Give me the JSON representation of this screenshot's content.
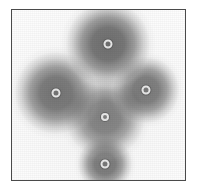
{
  "image": {
    "kind": "scanning-probe-micrograph",
    "width": 203,
    "height": 196,
    "background_color": "#ffffff",
    "frame": {
      "x": 11,
      "y": 9,
      "width": 175,
      "height": 172,
      "border_color": "#4a4a4a",
      "border_width": 1,
      "fill_color": "#ffffff"
    },
    "colormap": "grayscale",
    "lobe_dark_color": "#5a5a5a",
    "lobe_core_color": "#4e4e4e",
    "marker_ring_color": "#e8e8e8",
    "caption": ""
  },
  "chart_data": {
    "type": "heatmap",
    "title": "",
    "xlabel": "",
    "ylabel": "",
    "grid": false,
    "legend": "none",
    "xlim": [
      0,
      175
    ],
    "ylim": [
      0,
      172
    ],
    "features": [
      {
        "name": "top-lobe",
        "cx": 96,
        "cy": 34,
        "radius": 48,
        "intensity": 0.92,
        "marker": {
          "cx": 96,
          "cy": 34,
          "outer_d": 9,
          "inner_d": 5
        }
      },
      {
        "name": "left-lobe",
        "cx": 44,
        "cy": 83,
        "radius": 47,
        "intensity": 0.88,
        "marker": {
          "cx": 44,
          "cy": 83,
          "outer_d": 9,
          "inner_d": 5
        }
      },
      {
        "name": "right-lobe",
        "cx": 134,
        "cy": 80,
        "radius": 38,
        "intensity": 0.85,
        "marker": {
          "cx": 134,
          "cy": 80,
          "outer_d": 9,
          "inner_d": 5
        }
      },
      {
        "name": "center-lobe",
        "cx": 93,
        "cy": 107,
        "radius": 46,
        "intensity": 0.8,
        "marker": {
          "cx": 93,
          "cy": 107,
          "outer_d": 8,
          "inner_d": 4
        }
      },
      {
        "name": "bottom-lobe",
        "cx": 93,
        "cy": 154,
        "radius": 31,
        "intensity": 0.86,
        "marker": {
          "cx": 93,
          "cy": 154,
          "outer_d": 9,
          "inner_d": 5
        }
      }
    ],
    "markers": [
      {
        "label": "top",
        "x": 96,
        "y": 34
      },
      {
        "label": "left",
        "x": 44,
        "y": 83
      },
      {
        "label": "right",
        "x": 134,
        "y": 80
      },
      {
        "label": "center",
        "x": 93,
        "y": 107
      },
      {
        "label": "bottom",
        "x": 93,
        "y": 154
      }
    ]
  }
}
